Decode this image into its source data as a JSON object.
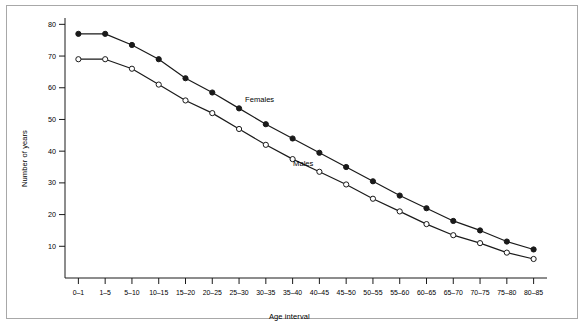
{
  "figure": {
    "background_color": "#ffffff",
    "frame_color": "#a8a8a8",
    "line_color": "#1a1a1a"
  },
  "chart_data": {
    "type": "line",
    "title": "",
    "xlabel": "Age interval",
    "ylabel": "Number of years",
    "categories": [
      "0–1",
      "1–5",
      "5–10",
      "10–15",
      "15–20",
      "20–25",
      "25–30",
      "30–35",
      "35–40",
      "40–45",
      "45–50",
      "50–55",
      "55–60",
      "60–65",
      "65–70",
      "70–75",
      "75–80",
      "80–85"
    ],
    "series": [
      {
        "name": "Females",
        "marker": "filled-circle",
        "values": [
          77,
          77,
          73.5,
          69,
          63,
          58.5,
          53.5,
          48.5,
          44,
          39.5,
          35,
          30.5,
          26,
          22,
          18,
          15,
          11.5,
          9
        ]
      },
      {
        "name": "Males",
        "marker": "open-circle",
        "values": [
          69,
          69,
          66,
          61,
          56,
          52,
          47,
          42,
          37.5,
          33.5,
          29.5,
          25,
          21,
          17,
          13.5,
          11,
          8,
          6
        ]
      }
    ],
    "ylim": [
      0,
      82
    ],
    "yticks": [
      10,
      20,
      30,
      40,
      50,
      60,
      70,
      80
    ],
    "grid": false,
    "legend_position": "inline-annotation",
    "annotations": [
      {
        "text": "Females",
        "series": "Females"
      },
      {
        "text": "Males",
        "series": "Males"
      }
    ]
  }
}
